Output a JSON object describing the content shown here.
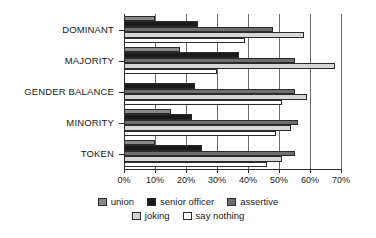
{
  "chart_data": {
    "type": "bar",
    "orientation": "horizontal",
    "title": "",
    "xlabel": "",
    "ylabel": "",
    "xlim": [
      0,
      70
    ],
    "grid": true,
    "legend_position": "bottom",
    "categories": [
      "DOMINANT",
      "MAJORITY",
      "GENDER BALANCE",
      "MINORITY",
      "TOKEN"
    ],
    "xticks": [
      "0%",
      "10%",
      "20%",
      "30%",
      "40%",
      "50%",
      "60%",
      "70%"
    ],
    "xtick_values": [
      0,
      10,
      20,
      30,
      40,
      50,
      60,
      70
    ],
    "series": [
      {
        "name": "union",
        "color": "#8a8a8a",
        "values": [
          10,
          18,
          0,
          15,
          10
        ]
      },
      {
        "name": "senior officer",
        "color": "#1a1a1a",
        "values": [
          24,
          37,
          23,
          22,
          25
        ]
      },
      {
        "name": "assertive",
        "color": "#6e6e6e",
        "values": [
          48,
          55,
          55,
          56,
          55
        ]
      },
      {
        "name": "joking",
        "color": "#d6d6d6",
        "values": [
          58,
          68,
          59,
          54,
          51
        ]
      },
      {
        "name": "say nothing",
        "color": "#ffffff",
        "values": [
          39,
          30,
          51,
          49,
          46
        ]
      }
    ]
  },
  "legend": {
    "items": [
      {
        "label": "union"
      },
      {
        "label": "senior officer"
      },
      {
        "label": "assertive"
      },
      {
        "label": "joking"
      },
      {
        "label": "say nothing"
      }
    ]
  }
}
